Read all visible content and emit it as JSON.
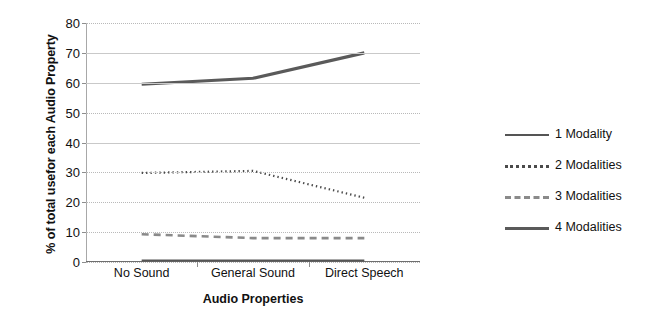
{
  "chart_data": {
    "type": "line",
    "title": "",
    "xlabel": "Audio Properties",
    "ylabel": "% of total usefor  each Audio Property",
    "categories": [
      "No Sound",
      "General Sound",
      "Direct Speech"
    ],
    "ylim": [
      0,
      80
    ],
    "yticks": [
      0,
      10,
      20,
      30,
      40,
      50,
      60,
      70,
      80
    ],
    "grid": true,
    "legend_position": "right",
    "series": [
      {
        "name": "1 Modality",
        "style": "solid",
        "values": [
          0.5,
          0.5,
          0.5
        ]
      },
      {
        "name": "2 Modalities",
        "style": "dotted",
        "values": [
          29.8,
          30.5,
          21.5
        ]
      },
      {
        "name": "3 Modalities",
        "style": "dashed",
        "values": [
          9.3,
          8.0,
          8.0
        ]
      },
      {
        "name": "4 Modalities",
        "style": "solid-thick",
        "values": [
          59.5,
          61.5,
          70.0
        ]
      }
    ]
  },
  "axis": {
    "y_title": "% of total usefor  each Audio Property",
    "x_title": "Audio Properties",
    "y_tick_labels": [
      "80",
      "70",
      "60",
      "50",
      "40",
      "30",
      "20",
      "10",
      "0"
    ],
    "x_tick_labels": [
      "No Sound",
      "General Sound",
      "Direct Speech"
    ]
  },
  "legend": {
    "items": [
      {
        "label": "1 Modality",
        "swatch": "line-solid-swatch"
      },
      {
        "label": "2 Modalities",
        "swatch": "line-dotted-swatch"
      },
      {
        "label": "3 Modalities",
        "swatch": "line-dashed-swatch"
      },
      {
        "label": "4 Modalities",
        "swatch": "line-solid-thick-swatch"
      }
    ]
  },
  "colors": {
    "series_1": "#555555",
    "series_2": "#4a4a4a",
    "series_3": "#8a8a8a",
    "series_4": "#5a5a5a",
    "grid": "#b9b9b9",
    "axis": "#6e6e6e",
    "background": "#ffffff"
  }
}
